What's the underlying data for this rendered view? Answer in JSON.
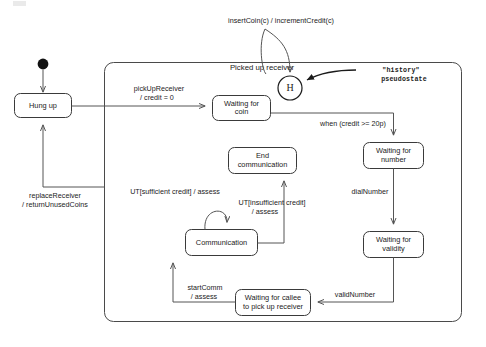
{
  "diagram": {
    "type": "uml-state-machine",
    "composite_state": {
      "name": "Picked up receiver"
    },
    "note": {
      "line1": "\"history\"",
      "line2": "pseudostate"
    },
    "history_symbol": "H",
    "states": [
      {
        "id": "hung-up",
        "label_line1": "Hung up",
        "label_line2": ""
      },
      {
        "id": "waiting-coin",
        "label_line1": "Waiting for",
        "label_line2": "coin"
      },
      {
        "id": "waiting-number",
        "label_line1": "Waiting for",
        "label_line2": "number"
      },
      {
        "id": "waiting-validity",
        "label_line1": "Waiting for",
        "label_line2": "validity"
      },
      {
        "id": "waiting-callee",
        "label_line1": "Waiting for callee",
        "label_line2": "to pick up receiver"
      },
      {
        "id": "communication",
        "label_line1": "Communication",
        "label_line2": ""
      },
      {
        "id": "end-communication",
        "label_line1": "End",
        "label_line2": "communication"
      }
    ],
    "transitions": [
      {
        "id": "t-insert-coin",
        "line1": "insertCoin(c) / incrementCredit(c)",
        "line2": ""
      },
      {
        "id": "t-pickup",
        "line1": "pickUpReceiver",
        "line2": "/ credit = 0"
      },
      {
        "id": "t-credit",
        "line1": "when (credit >= 20p)",
        "line2": ""
      },
      {
        "id": "t-dial",
        "line1": "dialNumber",
        "line2": ""
      },
      {
        "id": "t-valid",
        "line1": "validNumber",
        "line2": ""
      },
      {
        "id": "t-startcomm",
        "line1": "startComm",
        "line2": "/ assess"
      },
      {
        "id": "t-ut-sufficient",
        "line1": "UT[sufficient credit] / assess",
        "line2": ""
      },
      {
        "id": "t-ut-insufficient",
        "line1": "UT[insufficient credit]",
        "line2": "/ assess"
      },
      {
        "id": "t-replace",
        "line1": "replaceReceiver",
        "line2": "/ returnUnusedCoins"
      }
    ],
    "colors": {
      "background": "#ffffff",
      "stroke": "#3a3a3a",
      "edge": "#555555",
      "text": "#1b1b1b",
      "initial_node": "#111111"
    }
  }
}
